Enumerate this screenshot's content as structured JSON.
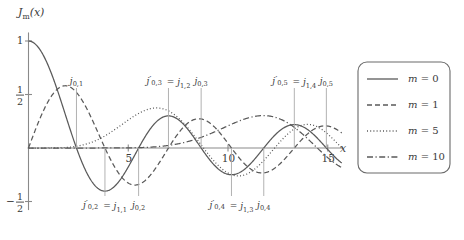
{
  "figure": {
    "background": "#ffffff",
    "axis_color": "#8a8a8a",
    "curve_color": "#5a5a5a",
    "text_color": "#3a3a3a",
    "ylabel": "Jm(x)",
    "xlabel": "x",
    "ytick_labels": [
      "1",
      "1/2",
      "-1/2"
    ],
    "xtick_labels": [
      "5",
      "10",
      "15"
    ]
  },
  "legend": {
    "box_color": "#6a6a6a",
    "entries": [
      {
        "label": "m = 0",
        "dash": "none",
        "m": 0
      },
      {
        "label": "m = 1",
        "dash": "dashed",
        "m": 1
      },
      {
        "label": "m = 5",
        "dash": "dotted",
        "m": 5
      },
      {
        "label": "m = 10",
        "dash": "dashdot",
        "m": 10
      }
    ]
  },
  "annotations": [
    {
      "name": "j01",
      "text": "j0,1",
      "x": 2.405,
      "side": "top"
    },
    {
      "name": "j02p-j11",
      "text": "j'0,2 = j1,1",
      "x": 3.832,
      "side": "bottom"
    },
    {
      "name": "j02",
      "text": "j0,2",
      "x": 5.52,
      "side": "bottom"
    },
    {
      "name": "j03p-j12",
      "text": "j'0,3 = j1,2",
      "x": 7.016,
      "side": "top"
    },
    {
      "name": "j03",
      "text": "j0,3",
      "x": 8.654,
      "side": "top"
    },
    {
      "name": "j04p-j13",
      "text": "j'0,4 = j1,3",
      "x": 10.174,
      "side": "bottom"
    },
    {
      "name": "j04",
      "text": "j0,4",
      "x": 11.792,
      "side": "bottom"
    },
    {
      "name": "j05p-j14",
      "text": "j'0,5 = j1,4",
      "x": 13.324,
      "side": "top"
    },
    {
      "name": "j05",
      "text": "j0,5",
      "x": 14.931,
      "side": "top"
    }
  ],
  "chart_data": {
    "type": "line",
    "title": "",
    "xlabel": "x",
    "ylabel": "Jm(x)",
    "xlim": [
      0,
      15.6
    ],
    "ylim": [
      -0.55,
      1.05
    ],
    "grid": false,
    "legend_position": "right",
    "x": [
      0,
      0.25,
      0.5,
      0.75,
      1,
      1.25,
      1.5,
      1.75,
      2,
      2.25,
      2.5,
      2.75,
      3,
      3.25,
      3.5,
      3.75,
      4,
      4.25,
      4.5,
      4.75,
      5,
      5.25,
      5.5,
      5.75,
      6,
      6.25,
      6.5,
      6.75,
      7,
      7.25,
      7.5,
      7.75,
      8,
      8.25,
      8.5,
      8.75,
      9,
      9.25,
      9.5,
      9.75,
      10,
      10.25,
      10.5,
      10.75,
      11,
      11.25,
      11.5,
      11.75,
      12,
      12.25,
      12.5,
      12.75,
      13,
      13.25,
      13.5,
      13.75,
      14,
      14.25,
      14.5,
      14.75,
      15,
      15.25,
      15.5
    ],
    "series": [
      {
        "name": "m = 0",
        "dash": "none",
        "values": [
          1.0,
          0.9844,
          0.9385,
          0.8642,
          0.7652,
          0.6459,
          0.5118,
          0.369,
          0.2239,
          0.0827,
          -0.0484,
          -0.1641,
          -0.2601,
          -0.3325,
          -0.3801,
          -0.4026,
          -0.3971,
          -0.3766,
          -0.3205,
          -0.2459,
          -0.1776,
          -0.0968,
          -0.0068,
          0.0801,
          0.1506,
          0.2101,
          0.2601,
          0.2951,
          0.3001,
          0.2951,
          0.2663,
          0.2255,
          0.1717,
          0.1043,
          0.0419,
          -0.0204,
          -0.0903,
          -0.1408,
          -0.1939,
          -0.2244,
          -0.2459,
          -0.244,
          -0.2366,
          -0.2097,
          -0.1712,
          -0.1269,
          -0.0677,
          -0.012,
          0.0477,
          0.1015,
          0.1469,
          0.187,
          0.2069,
          0.2198,
          0.2178,
          0.203,
          0.1711,
          0.1363,
          0.0917,
          0.0405,
          -0.0142,
          -0.0664,
          -0.1157
        ]
      },
      {
        "name": "m = 1",
        "dash": "dashed",
        "values": [
          0.0,
          0.124,
          0.2423,
          0.3492,
          0.4401,
          0.5106,
          0.5579,
          0.5802,
          0.5767,
          0.5484,
          0.4971,
          0.426,
          0.3391,
          0.2413,
          0.1374,
          0.0329,
          -0.066,
          -0.1557,
          -0.2311,
          -0.2882,
          -0.3276,
          -0.3414,
          -0.3414,
          -0.3195,
          -0.2767,
          -0.2245,
          -0.1538,
          -0.0826,
          -0.0047,
          0.0665,
          0.1352,
          0.1869,
          0.2346,
          0.2625,
          0.2731,
          0.2716,
          0.2453,
          0.211,
          0.1613,
          0.1067,
          0.0435,
          -0.0127,
          -0.0689,
          -0.1142,
          -0.1768,
          -0.2,
          -0.2284,
          -0.2325,
          -0.2234,
          -0.2014,
          -0.1655,
          -0.1263,
          -0.0703,
          -0.0246,
          0.038,
          0.0855,
          0.1334,
          0.1711,
          0.1968,
          0.2122,
          0.2051,
          0.1889,
          0.1605
        ]
      },
      {
        "name": "m = 5",
        "dash": "dotted",
        "values": [
          0.0,
          0.0,
          0.0002,
          0.0017,
          0.0025,
          0.0074,
          0.0179,
          0.0364,
          0.0704,
          0.1077,
          0.1468,
          0.195,
          0.2411,
          0.285,
          0.3233,
          0.3478,
          0.3648,
          0.3702,
          0.3648,
          0.345,
          0.2611,
          0.2214,
          0.1496,
          0.0826,
          0.0621,
          0.0,
          -0.057,
          -0.108,
          -0.1991,
          -0.2277,
          -0.2538,
          -0.27,
          -0.2906,
          -0.2961,
          -0.273,
          -0.2421,
          -0.2196,
          -0.18,
          -0.1213,
          -0.0671,
          -0.234,
          -0.17,
          -0.1,
          -0.039,
          0.016,
          0.066,
          0.11,
          0.148,
          0.18,
          0.203,
          0.218,
          0.224,
          0.22,
          0.209,
          0.19,
          0.163,
          0.13,
          0.093,
          0.053,
          0.012,
          -0.03,
          -0.071,
          -0.108
        ]
      },
      {
        "name": "m = 10",
        "dash": "dashdot",
        "values": [
          0.0,
          0.0,
          0.0,
          0.0,
          0.0,
          0.0,
          0.0,
          0.0,
          0.0001,
          0.0003,
          0.0008,
          0.002,
          0.0044,
          0.0087,
          0.0159,
          0.027,
          0.0429,
          0.0644,
          0.0914,
          0.1234,
          0.159,
          0.1961,
          0.2322,
          0.2638,
          0.2875,
          0.3005,
          0.3004,
          0.2868,
          0.26,
          0.222,
          0.1751,
          0.1227,
          0.0679,
          0.0137,
          -0.0375,
          -0.0831,
          -0.121,
          -0.1495,
          -0.1674,
          -0.1744,
          -0.1751,
          -0.157,
          -0.1318,
          -0.0987,
          -0.0602,
          -0.0182,
          0.0248,
          0.066,
          0.1028,
          0.133,
          0.1549,
          0.1674,
          0.17,
          0.163,
          0.147,
          0.123,
          0.093,
          0.058,
          0.021,
          -0.016,
          -0.052,
          -0.084,
          -0.111
        ]
      }
    ]
  }
}
